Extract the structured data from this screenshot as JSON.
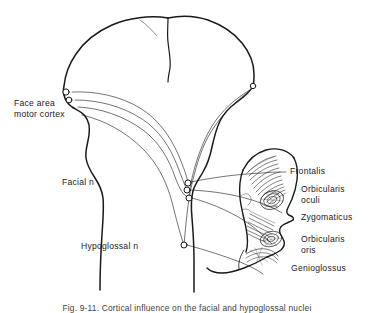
{
  "figure": {
    "type": "anatomical-diagram",
    "view": "coronal brain section with lateral head profile",
    "background_color": "#ffffff",
    "line_color": "#1a1a1a",
    "caption": "Fig. 9-11. Cortical influence on the facial and hypoglossal nuclei"
  },
  "labels": {
    "face_area_motor_cortex": "Face area\nmotor cortex",
    "face_area_line1": "Face area",
    "face_area_line2": "motor cortex",
    "facial_n": "Facial n",
    "hypoglossal_n": "Hypoglossal n",
    "frontalis": "Frontalis",
    "orbicularis_oculi_line1": "Orbicularis",
    "orbicularis_oculi_line2": "oculi",
    "zygomaticus": "Zygomaticus",
    "orbicularis_oris_line1": "Orbicularis",
    "orbicularis_oris_line2": "oris",
    "genioglossus": "Genioglossus"
  },
  "structures": {
    "brain": "cerebral hemispheres coronal section",
    "brainstem": "brainstem and spinal cord",
    "head_profile": "lateral face profile",
    "nuclei": [
      {
        "name": "cortical-neuron-left-upper",
        "x": 66,
        "y": 92
      },
      {
        "name": "cortical-neuron-left-lower",
        "x": 69,
        "y": 100
      },
      {
        "name": "cortical-neuron-right",
        "x": 253,
        "y": 86
      },
      {
        "name": "facial-nucleus-upper",
        "x": 188,
        "y": 183
      },
      {
        "name": "facial-nucleus-mid",
        "x": 187,
        "y": 190
      },
      {
        "name": "facial-nucleus-lower",
        "x": 189,
        "y": 198
      },
      {
        "name": "hypoglossal-nucleus",
        "x": 184,
        "y": 245
      }
    ]
  }
}
